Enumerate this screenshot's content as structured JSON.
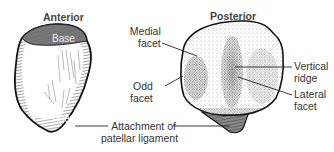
{
  "diagram": {
    "views": [
      {
        "id": "anterior",
        "title": "Anterior",
        "labels": [
          {
            "id": "base",
            "text": "Base"
          },
          {
            "id": "apex",
            "text": "Apex"
          }
        ]
      },
      {
        "id": "posterior",
        "title": "Posterior",
        "labels": [
          {
            "id": "medial-facet",
            "line1": "Medial",
            "line2": "facet"
          },
          {
            "id": "odd-facet",
            "line1": "Odd",
            "line2": "facet"
          },
          {
            "id": "vertical-ridge",
            "line1": "Vertical",
            "line2": "ridge"
          },
          {
            "id": "lateral-facet",
            "line1": "Lateral",
            "line2": "facet"
          }
        ]
      }
    ],
    "shared_labels": [
      {
        "id": "patellar-ligament",
        "line1": "Attachment of",
        "line2": "patellar ligament"
      }
    ],
    "colors": {
      "outline": "#1a1a1a",
      "shade_dark": "#555555",
      "stipple": "#3a3a3a",
      "background": "#ffffff"
    }
  }
}
